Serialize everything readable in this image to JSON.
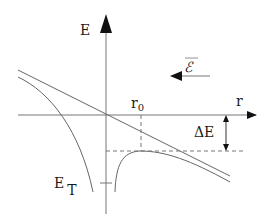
{
  "diagram": {
    "type": "potential-energy-diagram",
    "axes": {
      "y_label": "E",
      "x_label": "r"
    },
    "labels": {
      "field": "ℰ",
      "r0": "r",
      "r0_sub": "0",
      "delta_e": "ΔE",
      "e_t": "E",
      "e_t_sub": "T"
    },
    "colors": {
      "line": "#555555",
      "axis": "#444444",
      "arrow": "#111111"
    }
  }
}
